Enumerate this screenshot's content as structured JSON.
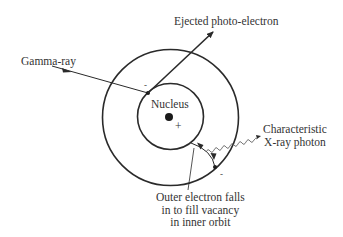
{
  "labels": {
    "gamma_ray": "Gamma-ray",
    "ejected": "Ejected photo-electron",
    "nucleus": "Nucleus",
    "nucleus_charge": "+",
    "electron_charge_inner": "-",
    "electron_charge_outer": "-",
    "xray": [
      "Characteristic",
      "X-ray photon"
    ],
    "outer_falls": [
      "Outer electron falls",
      "in to fill vacancy",
      "in inner orbit"
    ]
  },
  "colors": {
    "line": "#2a2a2a",
    "background": "#ffffff"
  }
}
